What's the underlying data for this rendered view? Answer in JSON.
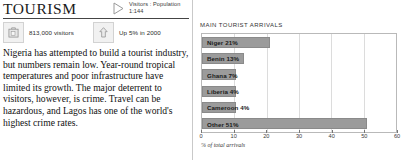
{
  "section": {
    "title": "TOURISM",
    "ratio_icon": "triangle-right-icon",
    "ratio_text": "Visitors : Population\n1:144"
  },
  "stats": [
    {
      "icon": "suitcase-icon",
      "label": "813,000 visitors"
    },
    {
      "icon": "up-arrow-icon",
      "label": "Up 5% in 2000"
    }
  ],
  "body": {
    "paragraph": "Nigeria has attempted to build a tourist industry, but numbers remain low. Year-round tropical temperatures and poor infrastructure have limited its growth. The major deterrent to visitors, however, is crime. Travel can be hazardous, and Lagos has one of the world's highest crime rates."
  },
  "chart_data": {
    "type": "bar",
    "orientation": "horizontal",
    "title": "MAIN TOURIST ARRIVALS",
    "xlabel": "% of total arrivals",
    "ylabel": "",
    "xlim": [
      0,
      60
    ],
    "xticks": [
      0,
      10,
      20,
      30,
      40,
      50,
      60
    ],
    "grid": true,
    "legend": "none",
    "categories": [
      "Niger",
      "Benin",
      "Ghana",
      "Liberia",
      "Cameroon",
      "Other"
    ],
    "values": [
      21,
      13,
      7,
      4,
      4,
      51
    ],
    "bar_labels": [
      "Niger 21%",
      "Benin 13%",
      "Ghana 7%",
      "Liberia 4%",
      "Cameroon 4%",
      "Other 51%"
    ],
    "bar_color": "#9b9b9b"
  }
}
